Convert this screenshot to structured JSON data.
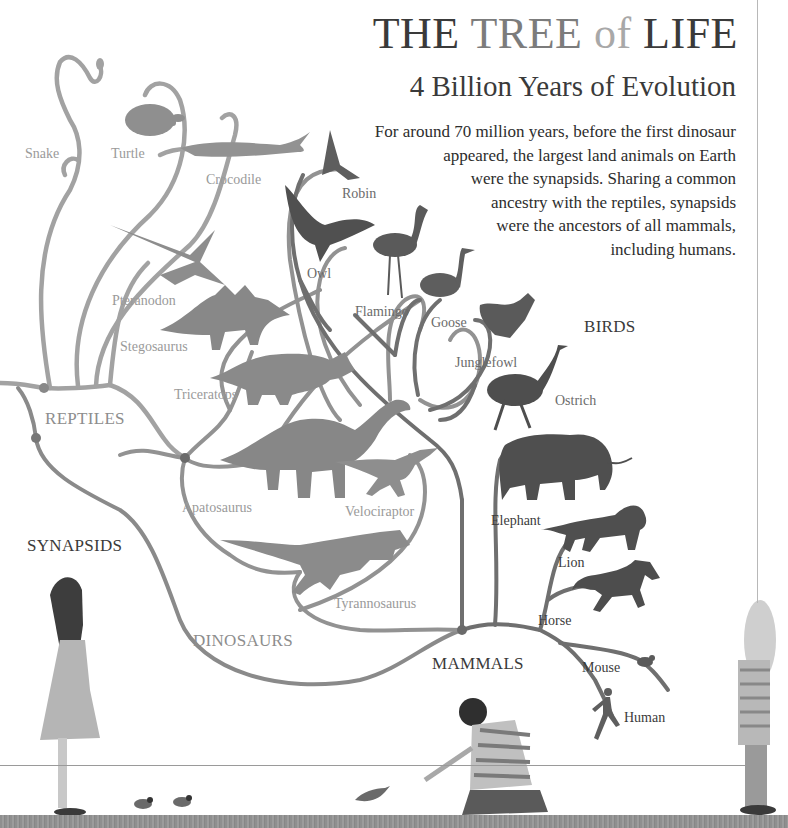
{
  "header": {
    "title_part1": "THE",
    "title_part2": "TREE",
    "title_part3": "of",
    "title_part4": "LIFE",
    "subtitle": "4 Billion Years of Evolution"
  },
  "intro": {
    "lines": [
      "For around 70 million years, before the first dinosaur",
      "appeared, the largest land animals on Earth",
      "were the synapsids. Sharing a common",
      "ancestry with the reptiles, synapsids",
      "were the ancestors of all mammals,",
      "including humans."
    ]
  },
  "groups": {
    "reptiles": "REPTILES",
    "synapsids": "SYNAPSIDS",
    "dinosaurs": "DINOSAURS",
    "birds": "BIRDS",
    "mammals": "MAMMALS"
  },
  "animals": {
    "snake": "Snake",
    "turtle": "Turtle",
    "crocodile": "Crocodile",
    "pteranodon": "Pteranodon",
    "stegosaurus": "Stegosaurus",
    "triceratops": "Triceratops",
    "apatosaurus": "Apatosaurus",
    "velociraptor": "Velociraptor",
    "tyrannosaurus": "Tyrannosaurus",
    "robin": "Robin",
    "owl": "Owl",
    "flamingo": "Flamingo",
    "goose": "Goose",
    "junglefowl": "Junglefowl",
    "ostrich": "Ostrich",
    "elephant": "Elephant",
    "lion": "Lion",
    "horse": "Horse",
    "mouse": "Mouse",
    "human": "Human"
  },
  "colors": {
    "branch_light": "#9e9e9e",
    "branch_dark": "#6e6e6e",
    "silhouette_light": "#8c8c8c",
    "silhouette_dark": "#4e4e4e",
    "ground": "#929292"
  }
}
